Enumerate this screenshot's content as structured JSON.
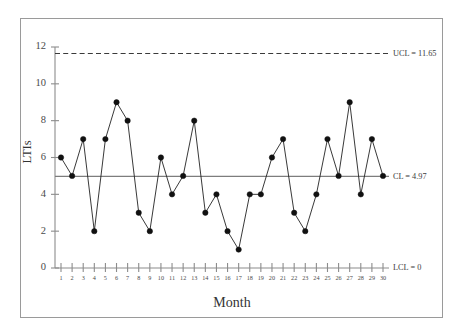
{
  "figure": {
    "frame_border_color": "#9a9a9a",
    "background": "#ffffff"
  },
  "chart_data": {
    "type": "line",
    "title": "",
    "subtitle": "",
    "xlabel": "Month",
    "ylabel": "LTIs",
    "x": [
      1,
      2,
      3,
      4,
      5,
      6,
      7,
      8,
      9,
      10,
      11,
      12,
      13,
      14,
      15,
      16,
      17,
      18,
      19,
      20,
      21,
      22,
      23,
      24,
      25,
      26,
      27,
      28,
      29,
      30
    ],
    "categories": [
      "1",
      "2",
      "3",
      "4",
      "5",
      "6",
      "7",
      "8",
      "9",
      "10",
      "11",
      "12",
      "13",
      "14",
      "15",
      "16",
      "17",
      "18",
      "19",
      "20",
      "21",
      "22",
      "23",
      "24",
      "25",
      "26",
      "27",
      "28",
      "29",
      "30"
    ],
    "values": [
      6,
      5,
      7,
      2,
      7,
      9,
      8,
      3,
      2,
      6,
      4,
      5,
      8,
      3,
      4,
      2,
      1,
      4,
      4,
      6,
      7,
      3,
      2,
      4,
      7,
      5,
      9,
      4,
      7,
      5
    ],
    "series": [
      {
        "name": "LTIs",
        "values": [
          6,
          5,
          7,
          2,
          7,
          9,
          8,
          3,
          2,
          6,
          4,
          5,
          8,
          3,
          4,
          2,
          1,
          4,
          4,
          6,
          7,
          3,
          2,
          4,
          7,
          5,
          9,
          4,
          7,
          5
        ],
        "marker": "filled-circle",
        "color": "#111111"
      }
    ],
    "ylim": [
      0,
      12
    ],
    "xlim": [
      1,
      30
    ],
    "yticks": [
      0,
      2,
      4,
      6,
      8,
      10,
      12
    ],
    "ytick_labels": [
      "0",
      "2",
      "4",
      "6",
      "8",
      "10",
      "12"
    ],
    "xticks": [
      1,
      2,
      3,
      4,
      5,
      6,
      7,
      8,
      9,
      10,
      11,
      12,
      13,
      14,
      15,
      16,
      17,
      18,
      19,
      20,
      21,
      22,
      23,
      24,
      25,
      26,
      27,
      28,
      29,
      30
    ],
    "grid": false,
    "legend": false,
    "legend_position": "none",
    "control_limits": [
      {
        "name": "UCL",
        "label": "UCL = 11.65",
        "value": 11.65,
        "style": "dashed",
        "color": "#3a3a3a"
      },
      {
        "name": "CL",
        "label": "CL = 4.97",
        "value": 4.97,
        "style": "solid",
        "color": "#7d7d7d"
      },
      {
        "name": "LCL",
        "label": "LCL = 0",
        "value": 0,
        "style": "solid",
        "color": "#8c8c8c"
      }
    ]
  }
}
